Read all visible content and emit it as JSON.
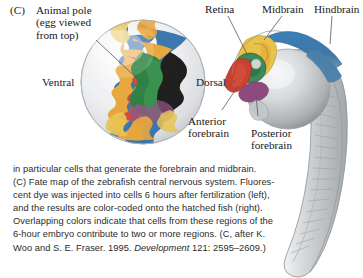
{
  "figure": {
    "panel_letter": "(C)",
    "labels": {
      "animal_pole": "Animal pole\n(egg viewed\nfrom top)",
      "ventral": "Ventral",
      "dorsal": "Dorsal",
      "retina": "Retina",
      "midbrain": "Midbrain",
      "hindbrain": "Hindbrain",
      "anterior_forebrain": "Anterior\nforebrain",
      "posterior_forebrain": "Posterior\nforebrain"
    },
    "colors": {
      "hindbrain_blue": "#2f6ea8",
      "midbrain_yellow": "#e8c24a",
      "midbrain_orange": "#e8a231",
      "retina_green": "#1f7a36",
      "retina_green_fish": "#3e8a5c",
      "anterior_forebrain_red": "#cc4030",
      "posterior_forebrain_purple": "#8e4a7e",
      "dorsal_black": "#12100e",
      "egg_shell": "#e9eaec",
      "body_grey": "#b9bcbe",
      "leader_line": "#5a5a5a"
    }
  },
  "caption": {
    "lines": [
      "in particular cells that generate the forebrain and midbrain.",
      "(C) Fate map of the zebrafish central nervous system. Fluores-",
      "cent dye was injected into cells 6 hours after fertilization (left),",
      "and the results are color-coded onto the hatched fish (right).",
      "Overlapping colors indicate that cells from these regions of the",
      "6-hour embryo contribute to two or more regions. (C, after K."
    ],
    "last_line_pre": "Woo and S. E. Fraser. 1995. ",
    "last_line_italic": "Development",
    "last_line_post": " 121: 2595–2609.)"
  }
}
